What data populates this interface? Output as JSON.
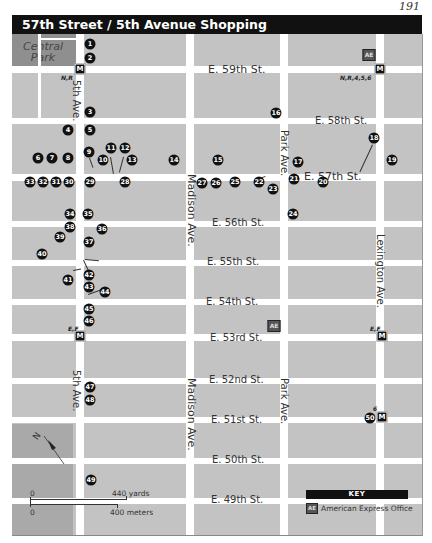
{
  "page_number": "191",
  "title": "57th Street / 5th Avenue Shopping",
  "colors": {
    "block": "#c3c3c3",
    "park": "#8f8f8f",
    "road": "#ffffff",
    "title_bar": "#111111",
    "pin": "#111111"
  },
  "park": {
    "label_line1": "Central",
    "label_line2": "Park"
  },
  "avenues": [
    {
      "name": "5th Ave.",
      "label": "5th Ave."
    },
    {
      "name": "Madison Ave.",
      "label": "Madison Ave."
    },
    {
      "name": "Park Ave.",
      "label": "Park Ave."
    },
    {
      "name": "Lexington Ave.",
      "label": "Lexington Ave."
    }
  ],
  "streets": [
    {
      "label": "E. 59th St."
    },
    {
      "label": "E. 58th St."
    },
    {
      "label": "E. 57th St."
    },
    {
      "label": "E. 56th St."
    },
    {
      "label": "E. 55th St."
    },
    {
      "label": "E. 54th St."
    },
    {
      "label": "E. 53rd St."
    },
    {
      "label": "E. 52nd St."
    },
    {
      "label": "E. 51st St."
    },
    {
      "label": "E. 50th St."
    },
    {
      "label": "E. 49th St."
    }
  ],
  "avenue_labels": {
    "fifth_upper": "5th Ave.",
    "fifth_lower": "5th Ave.",
    "madison_upper": "Madison Ave.",
    "madison_lower": "Madison Ave.",
    "park_upper": "Park Ave.",
    "park_lower": "Park Ave.",
    "lexington": "Lexington Ave."
  },
  "subway": [
    {
      "id": "m1",
      "glyph": "M",
      "lines": "N,R"
    },
    {
      "id": "m2",
      "glyph": "M",
      "lines": "N,R,4,5,6"
    },
    {
      "id": "m3",
      "glyph": "M",
      "lines": "E,F"
    },
    {
      "id": "m4",
      "glyph": "M",
      "lines": "E,F"
    },
    {
      "id": "m5",
      "glyph": "M",
      "lines": "6"
    }
  ],
  "amex_offices": [
    {
      "id": "ae1",
      "glyph": "AE"
    },
    {
      "id": "ae2",
      "glyph": "AE"
    }
  ],
  "pins": [
    "1",
    "2",
    "3",
    "4",
    "5",
    "6",
    "7",
    "8",
    "9",
    "10",
    "11",
    "12",
    "13",
    "14",
    "15",
    "16",
    "17",
    "18",
    "19",
    "20",
    "21",
    "22",
    "23",
    "24",
    "25",
    "26",
    "27",
    "28",
    "29",
    "30",
    "31",
    "32",
    "33",
    "34",
    "35",
    "36",
    "37",
    "38",
    "39",
    "40",
    "41",
    "42",
    "43",
    "44",
    "45",
    "46",
    "47",
    "48",
    "49",
    "50"
  ],
  "scale": {
    "yards_zero": "0",
    "yards_label": "440 yards",
    "meters_zero": "0",
    "meters_label": "400 meters"
  },
  "compass": {
    "label": "N"
  },
  "key": {
    "heading": "KEY",
    "items": [
      {
        "glyph": "AE",
        "label": "American Express Office"
      }
    ]
  }
}
